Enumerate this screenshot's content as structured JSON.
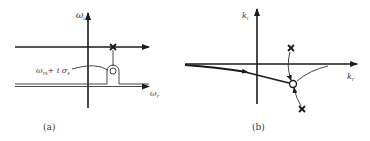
{
  "figure": {
    "panel_a": {
      "caption": "(a)",
      "vertical_axis_label": "ω",
      "vertical_axis_sub": "i",
      "horizontal_axis_label": "ω",
      "horizontal_axis_sub": "r",
      "point_label_main": "ω",
      "point_label_sub": "rs",
      "point_label_plus": "+ i σ",
      "point_label_sub2": "s",
      "elements": [
        "upper-horizontal-arrow-line",
        "pole-x-marker",
        "circle-marker",
        "keyhole-integration-contour"
      ]
    },
    "panel_b": {
      "caption": "(b)",
      "vertical_axis_label": "k",
      "vertical_axis_sub": "i",
      "horizontal_axis_label": "k",
      "horizontal_axis_sub": "r",
      "elements": [
        "deformed-contour-with-arrow",
        "upper-x-marker",
        "lower-x-marker",
        "pinch-circle-marker",
        "migration-arcs"
      ]
    }
  }
}
